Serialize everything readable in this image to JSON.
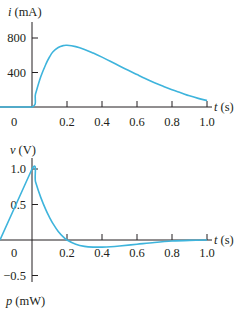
{
  "colors": {
    "curve": "#3eb4dc",
    "axis": "#231f20",
    "background": "#ffffff"
  },
  "chart_data": [
    {
      "type": "line",
      "title": "",
      "ylabel": "i (mA)",
      "ylabel_var": "i",
      "ylabel_unit": "(mA)",
      "xlabel": "t (s)",
      "xlabel_var": "t",
      "xlabel_unit": "(s)",
      "xlim": [
        0,
        1.0
      ],
      "ylim": [
        0,
        800
      ],
      "x_ticks": [
        0,
        0.2,
        0.4,
        0.6,
        0.8,
        1.0
      ],
      "x_tick_labels": [
        "0",
        "0.2",
        "0.4",
        "0.6",
        "0.8",
        "1.0"
      ],
      "y_ticks": [
        400,
        800
      ],
      "y_tick_labels": [
        "400",
        "800"
      ],
      "grid": false,
      "legend": null,
      "series": [
        {
          "name": "i(t)",
          "x": [
            -0.2,
            0.0,
            0.02,
            0.05,
            0.08,
            0.1,
            0.12,
            0.15,
            0.18,
            0.2,
            0.25,
            0.3,
            0.35,
            0.4,
            0.45,
            0.5,
            0.55,
            0.6,
            0.65,
            0.7,
            0.75,
            0.8,
            0.85,
            0.9,
            0.95,
            1.0
          ],
          "values": [
            0,
            0,
            150,
            350,
            500,
            580,
            640,
            690,
            712,
            716,
            700,
            668,
            625,
            578,
            528,
            476,
            425,
            376,
            328,
            282,
            240,
            200,
            165,
            130,
            100,
            75
          ]
        }
      ]
    },
    {
      "type": "line",
      "title": "",
      "ylabel": "v (V)",
      "ylabel_var": "v",
      "ylabel_unit": "(V)",
      "xlabel": "t (s)",
      "xlabel_var": "t",
      "xlabel_unit": "(s)",
      "xlim": [
        0,
        1.0
      ],
      "ylim": [
        -0.5,
        1.0
      ],
      "x_ticks": [
        0,
        0.2,
        0.4,
        0.6,
        0.8,
        1.0
      ],
      "x_tick_labels": [
        "0",
        "0.2",
        "0.4",
        "0.6",
        "0.8",
        "1.0"
      ],
      "y_ticks": [
        -0.5,
        0.5,
        1.0
      ],
      "y_tick_labels": [
        "−0.5",
        "0.5",
        "1.0"
      ],
      "zero_label": "0",
      "grid": false,
      "legend": null,
      "series": [
        {
          "name": "v(t)",
          "x": [
            -0.2,
            0.0,
            0.02,
            0.05,
            0.08,
            0.1,
            0.12,
            0.15,
            0.18,
            0.2,
            0.25,
            0.3,
            0.35,
            0.4,
            0.45,
            0.5,
            0.6,
            0.7,
            0.8,
            0.9,
            1.0
          ],
          "values": [
            0,
            1.0,
            0.82,
            0.6,
            0.42,
            0.32,
            0.23,
            0.12,
            0.04,
            0.0,
            -0.06,
            -0.09,
            -0.1,
            -0.1,
            -0.095,
            -0.085,
            -0.06,
            -0.035,
            -0.015,
            -0.005,
            0.0
          ]
        }
      ]
    }
  ],
  "next_plot_label": {
    "text": "p (mW)",
    "var": "p",
    "unit": "(mW)"
  }
}
